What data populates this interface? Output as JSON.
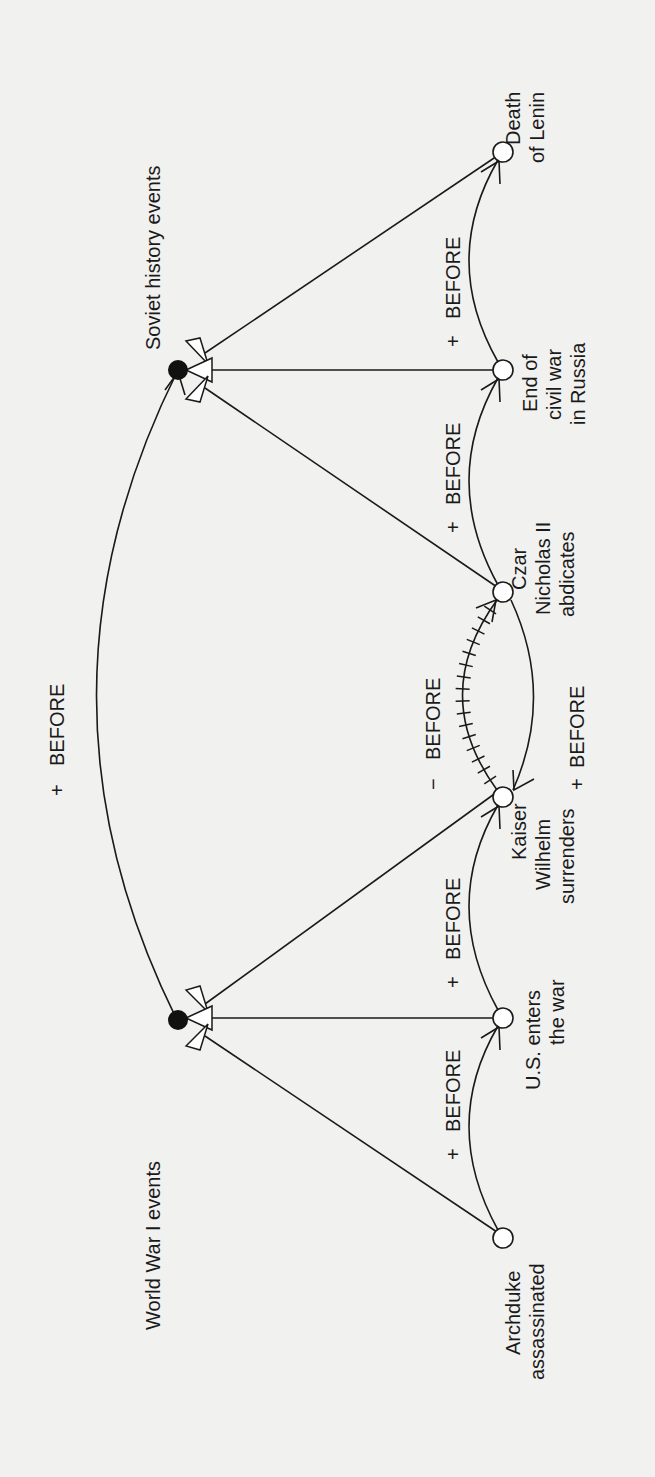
{
  "diagram": {
    "orientation": "rotated -90deg (read bottom-to-top)",
    "hubs": [
      {
        "id": "soviet",
        "label": "Soviet history events"
      },
      {
        "id": "wwi",
        "label": "World War I events"
      }
    ],
    "events": [
      {
        "id": "lenin",
        "lines": [
          "Death",
          "of Lenin"
        ],
        "group": "soviet"
      },
      {
        "id": "civilwar",
        "lines": [
          "End of",
          "civil war",
          "in Russia"
        ],
        "group": "soviet"
      },
      {
        "id": "czar",
        "lines": [
          "Czar",
          "Nicholas II",
          "abdicates"
        ],
        "group": "soviet"
      },
      {
        "id": "kaiser",
        "lines": [
          "Kaiser",
          "Wilhelm",
          "surrenders"
        ],
        "group": "wwi"
      },
      {
        "id": "us",
        "lines": [
          "U.S. enters",
          "the war"
        ],
        "group": "wwi"
      },
      {
        "id": "archduke",
        "lines": [
          "Archduke",
          "assassinated"
        ],
        "group": "wwi"
      }
    ],
    "relations": [
      {
        "from": "wwi",
        "to": "soviet",
        "label": "+ BEFORE",
        "sign": "+",
        "name": "BEFORE"
      },
      {
        "from": "archduke",
        "to": "us",
        "label": "+ BEFORE",
        "sign": "+",
        "name": "BEFORE"
      },
      {
        "from": "us",
        "to": "kaiser",
        "label": "+ BEFORE",
        "sign": "+",
        "name": "BEFORE"
      },
      {
        "from": "kaiser",
        "to": "czar",
        "label": "− BEFORE",
        "sign": "−",
        "name": "BEFORE",
        "negated": true
      },
      {
        "from": "czar",
        "to": "kaiser",
        "label": "+ BEFORE",
        "sign": "+",
        "name": "BEFORE"
      },
      {
        "from": "czar",
        "to": "civilwar",
        "label": "+ BEFORE",
        "sign": "+",
        "name": "BEFORE"
      },
      {
        "from": "civilwar",
        "to": "lenin",
        "label": "+ BEFORE",
        "sign": "+",
        "name": "BEFORE"
      }
    ],
    "labels": {
      "top_before": {
        "sign": "+",
        "word": "BEFORE"
      },
      "neg_before": {
        "sign": "−",
        "word": "BEFORE"
      },
      "czar_kaiser_before": {
        "sign": "+",
        "word": "BEFORE"
      },
      "arch_us_before": {
        "sign": "+",
        "word": "BEFORE"
      },
      "us_kaiser_before": {
        "sign": "+",
        "word": "BEFORE"
      },
      "czar_civil_before": {
        "sign": "+",
        "word": "BEFORE"
      },
      "civil_lenin_before": {
        "sign": "+",
        "word": "BEFORE"
      }
    }
  }
}
